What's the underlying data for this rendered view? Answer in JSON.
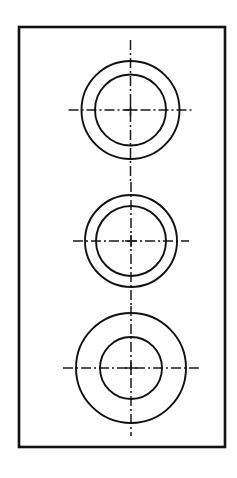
{
  "document": {
    "kind": "engineering-drawing",
    "description": "Mechanical plate drawing with three concentric circle pairs and centerlines",
    "background_color": "#ffffff",
    "line_color": "#111111",
    "canvas": {
      "width": 237,
      "height": 478
    }
  },
  "plate": {
    "name": "rectangular-plate-outline",
    "x": 19,
    "y": 27,
    "width": 206,
    "height": 420,
    "stroke_width": 2.6,
    "stroke_color": "#111111",
    "fill_color": "#ffffff"
  },
  "features": [
    {
      "id": "hole-top",
      "label": "Top counterbored hole",
      "center_x": 130.5,
      "center_y": 110,
      "outer_radius": 49,
      "inner_radius": 35.5,
      "stroke_width": 1.9,
      "centerline": {
        "horizontal_half_length": 62,
        "vertical_top": 40,
        "vertical_bottom": 182,
        "stroke_width": 1.5,
        "tick_half_length": 6
      }
    },
    {
      "id": "hole-middle",
      "label": "Middle counterbored hole",
      "center_x": 131,
      "center_y": 241,
      "outer_radius": 46,
      "inner_radius": 35,
      "stroke_width": 1.9,
      "centerline": {
        "horizontal_half_length": 58,
        "vertical_top": 182,
        "vertical_bottom": 306,
        "stroke_width": 1.5,
        "tick_half_length": 6
      }
    },
    {
      "id": "hole-bottom",
      "label": "Bottom counterbored hole",
      "center_x": 131,
      "center_y": 368,
      "outer_radius": 55,
      "inner_radius": 31,
      "stroke_width": 1.9,
      "centerline": {
        "horizontal_half_length": 68,
        "vertical_top": 306,
        "vertical_bottom": 436,
        "stroke_width": 1.5,
        "tick_half_length": 6
      }
    }
  ],
  "centerline_style": {
    "dash_pattern": "10 3 2 3",
    "color": "#1a1a1a"
  }
}
